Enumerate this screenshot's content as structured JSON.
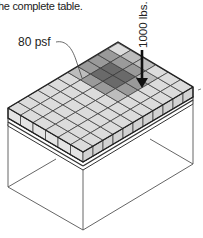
{
  "caption": "he complete table.",
  "labels": {
    "distributed_load": "80 psf",
    "point_load": "1000 lbs."
  },
  "figure": {
    "grid_rows": 10,
    "grid_cols": 14,
    "colors": {
      "cell_fill": "#dcdcdc",
      "cell_stroke": "#333333",
      "shade_dark": "#6a6a6a",
      "shade_mid": "#9a9a9a",
      "line": "#444444"
    }
  }
}
